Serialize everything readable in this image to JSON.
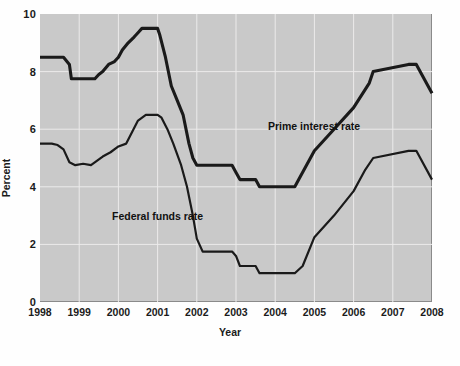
{
  "chart_data": {
    "type": "line",
    "title": "",
    "xlabel": "Year",
    "ylabel": "Percent",
    "xlim": [
      1998,
      2008
    ],
    "ylim": [
      0,
      10
    ],
    "grid": true,
    "legend_position": "inline-annotations",
    "x_tick_labels": [
      "1998",
      "1999",
      "2000",
      "2001",
      "2002",
      "2003",
      "2004",
      "2005",
      "2006",
      "2007",
      "2008"
    ],
    "x_ticks": [
      1998,
      1999,
      2000,
      2001,
      2002,
      2003,
      2004,
      2005,
      2006,
      2007,
      2008
    ],
    "y_tick_labels": [
      "0",
      "2",
      "4",
      "6",
      "8",
      "10"
    ],
    "y_ticks": [
      0,
      2,
      4,
      6,
      8,
      10
    ],
    "series": [
      {
        "name": "Prime interest rate",
        "annotation": "Prime interest rate",
        "x": [
          1998.0,
          1998.6,
          1998.75,
          1998.8,
          1999.4,
          1999.5,
          1999.6,
          1999.75,
          1999.9,
          2000.0,
          2000.1,
          2000.25,
          2000.4,
          2000.5,
          2000.6,
          2001.0,
          2001.05,
          2001.2,
          2001.35,
          2001.5,
          2001.65,
          2001.8,
          2001.9,
          2002.0,
          2002.1,
          2002.9,
          2003.0,
          2003.1,
          2003.5,
          2003.6,
          2004.0,
          2004.5,
          2004.6,
          2005.0,
          2005.5,
          2006.0,
          2006.4,
          2006.5,
          2007.4,
          2007.6,
          2008.0
        ],
        "y": [
          8.5,
          8.5,
          8.25,
          7.75,
          7.75,
          7.9,
          8.0,
          8.25,
          8.35,
          8.5,
          8.75,
          9.0,
          9.2,
          9.35,
          9.5,
          9.5,
          9.3,
          8.5,
          7.5,
          7.0,
          6.5,
          5.5,
          5.0,
          4.75,
          4.75,
          4.75,
          4.5,
          4.25,
          4.25,
          4.0,
          4.0,
          4.0,
          4.25,
          5.25,
          6.0,
          6.75,
          7.6,
          8.0,
          8.25,
          8.25,
          7.25
        ]
      },
      {
        "name": "Federal funds rate",
        "annotation": "Federal funds rate",
        "x": [
          1998.0,
          1998.3,
          1998.45,
          1998.6,
          1998.75,
          1998.9,
          1999.1,
          1999.3,
          1999.45,
          1999.6,
          1999.8,
          2000.0,
          2000.2,
          2000.35,
          2000.5,
          2000.7,
          2001.0,
          2001.1,
          2001.25,
          2001.4,
          2001.6,
          2001.75,
          2001.9,
          2002.0,
          2002.15,
          2002.9,
          2003.0,
          2003.1,
          2003.5,
          2003.6,
          2004.0,
          2004.5,
          2004.7,
          2005.0,
          2005.5,
          2006.0,
          2006.3,
          2006.5,
          2007.4,
          2007.6,
          2008.0
        ],
        "y": [
          5.5,
          5.5,
          5.45,
          5.3,
          4.85,
          4.75,
          4.8,
          4.75,
          4.9,
          5.05,
          5.2,
          5.4,
          5.5,
          5.9,
          6.3,
          6.5,
          6.5,
          6.4,
          6.0,
          5.5,
          4.75,
          4.0,
          3.0,
          2.2,
          1.75,
          1.75,
          1.6,
          1.25,
          1.25,
          1.0,
          1.0,
          1.0,
          1.25,
          2.25,
          3.0,
          3.85,
          4.6,
          5.0,
          5.25,
          5.25,
          4.25
        ]
      }
    ]
  },
  "axes": {
    "y_axis_title": "Percent",
    "x_axis_title": "Year"
  },
  "colors": {
    "plot_background": "#c9c9c9",
    "gridline": "#ecebeb",
    "line": "#1a1a1a",
    "text": "#1b1b1b"
  }
}
